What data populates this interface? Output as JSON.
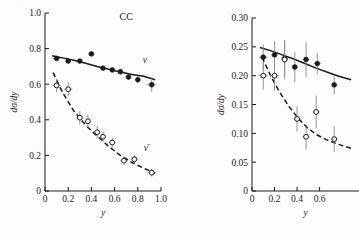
{
  "figure": {
    "background": "#fdfdfd",
    "ink_color": "#1a1a1a",
    "error_bar_color": "#8a8a8a"
  },
  "chart_data": [
    {
      "id": "left-panel",
      "type": "scatter",
      "title": "CC",
      "xlabel": "y",
      "ylabel": "dσ/dy",
      "xlim": [
        0,
        1.0
      ],
      "ylim": [
        0,
        1.0
      ],
      "xticks": [
        0,
        0.2,
        0.4,
        0.6,
        0.8,
        1.0
      ],
      "xticklabels": [
        "0",
        "0.2",
        "0.4",
        "0.6",
        "0.8",
        "1.0"
      ],
      "yticks": [
        0,
        0.2,
        0.4,
        0.6,
        0.8,
        1.0
      ],
      "yticklabels": [
        "0",
        "0.2",
        "0.4",
        "0.6",
        "0.8",
        "1.0"
      ],
      "grid": false,
      "legend_position": "inline-annotation",
      "series": [
        {
          "name": "ν",
          "label": "ν",
          "marker": "filled-circle",
          "curve": "solid",
          "label_x": 0.86,
          "label_y": 0.72,
          "x": [
            0.1,
            0.2,
            0.3,
            0.4,
            0.5,
            0.58,
            0.65,
            0.72,
            0.8,
            0.92
          ],
          "y": [
            0.745,
            0.73,
            0.73,
            0.77,
            0.69,
            0.68,
            0.67,
            0.64,
            0.625,
            0.597
          ],
          "yerr": [
            0.012,
            0.012,
            0.012,
            0.012,
            0.012,
            0.014,
            0.014,
            0.016,
            0.018,
            0.042
          ],
          "xerr": [
            0.035,
            0.025,
            0.025,
            0.03,
            0.025,
            0.025,
            0.025,
            0.025,
            0.025,
            0.04
          ],
          "fit_curve": [
            [
              0.06,
              0.76
            ],
            [
              0.15,
              0.748
            ],
            [
              0.25,
              0.735
            ],
            [
              0.35,
              0.718
            ],
            [
              0.45,
              0.7
            ],
            [
              0.55,
              0.684
            ],
            [
              0.65,
              0.668
            ],
            [
              0.75,
              0.655
            ],
            [
              0.85,
              0.645
            ],
            [
              0.95,
              0.625
            ]
          ]
        },
        {
          "name": "ν̄",
          "label": "ν̄",
          "marker": "open-circle",
          "curve": "dashed",
          "label_x": 0.87,
          "label_y": 0.225,
          "x": [
            0.1,
            0.2,
            0.3,
            0.37,
            0.45,
            0.5,
            0.58,
            0.68,
            0.77,
            0.92
          ],
          "y": [
            0.593,
            0.572,
            0.412,
            0.392,
            0.33,
            0.305,
            0.272,
            0.17,
            0.178,
            0.103
          ],
          "yerr": [
            0.037,
            0.04,
            0.038,
            0.035,
            0.035,
            0.03,
            0.028,
            0.022,
            0.024,
            0.022
          ],
          "xerr": [
            0.035,
            0.035,
            0.03,
            0.025,
            0.025,
            0.025,
            0.028,
            0.03,
            0.03,
            0.035
          ],
          "fit_curve": [
            [
              0.07,
              0.665
            ],
            [
              0.15,
              0.555
            ],
            [
              0.25,
              0.448
            ],
            [
              0.35,
              0.37
            ],
            [
              0.45,
              0.308
            ],
            [
              0.55,
              0.25
            ],
            [
              0.65,
              0.2
            ],
            [
              0.75,
              0.16
            ],
            [
              0.85,
              0.128
            ],
            [
              0.95,
              0.1
            ]
          ]
        }
      ]
    },
    {
      "id": "right-panel",
      "type": "scatter",
      "title": "",
      "xlabel": "y",
      "ylabel": "dσ/dy",
      "xlim": [
        0,
        0.95
      ],
      "ylim": [
        0,
        0.3
      ],
      "xticks": [
        0,
        0.2,
        0.4,
        0.6
      ],
      "xticklabels": [
        "0",
        "0.2",
        "0.4",
        "0.6"
      ],
      "yticks": [
        0,
        0.05,
        0.1,
        0.15,
        0.2,
        0.25,
        0.3
      ],
      "yticklabels": [
        "0",
        "0.05",
        "0.10",
        "0.15",
        "0.20",
        "0.25",
        "0.30"
      ],
      "grid": false,
      "cropped_right_edge": true,
      "series": [
        {
          "name": "ν",
          "label": "",
          "marker": "filled-circle",
          "curve": "solid",
          "x": [
            0.1,
            0.2,
            0.29,
            0.38,
            0.48,
            0.58,
            0.73
          ],
          "y": [
            0.232,
            0.236,
            0.23,
            0.215,
            0.228,
            0.221,
            0.184
          ],
          "yerr": [
            0.022,
            0.024,
            0.03,
            0.026,
            0.03,
            0.018,
            0.016
          ],
          "xerr": [
            0.04,
            0.03,
            0.03,
            0.03,
            0.03,
            0.03,
            0.03
          ],
          "fit_curve": [
            [
              0.07,
              0.249
            ],
            [
              0.17,
              0.243
            ],
            [
              0.27,
              0.236
            ],
            [
              0.37,
              0.229
            ],
            [
              0.47,
              0.221
            ],
            [
              0.57,
              0.213
            ],
            [
              0.67,
              0.206
            ],
            [
              0.77,
              0.199
            ],
            [
              0.88,
              0.193
            ]
          ]
        },
        {
          "name": "ν̄",
          "label": "",
          "marker": "open-circle",
          "curve": "dashed",
          "x": [
            0.1,
            0.2,
            0.29,
            0.4,
            0.48,
            0.57,
            0.73
          ],
          "y": [
            0.2,
            0.2,
            0.228,
            0.125,
            0.094,
            0.137,
            0.09
          ],
          "yerr": [
            0.024,
            0.026,
            0.034,
            0.022,
            0.022,
            0.028,
            0.022
          ],
          "xerr": [
            0.04,
            0.04,
            0.03,
            0.03,
            0.03,
            0.032,
            0.03
          ],
          "fit_curve": [
            [
              0.09,
              0.232
            ],
            [
              0.17,
              0.198
            ],
            [
              0.25,
              0.17
            ],
            [
              0.33,
              0.146
            ],
            [
              0.41,
              0.126
            ],
            [
              0.49,
              0.11
            ],
            [
              0.57,
              0.098
            ],
            [
              0.66,
              0.089
            ],
            [
              0.75,
              0.082
            ],
            [
              0.88,
              0.074
            ]
          ]
        }
      ]
    }
  ]
}
